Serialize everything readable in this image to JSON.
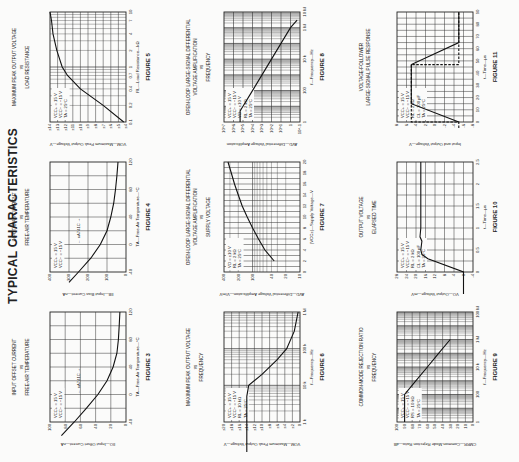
{
  "page": {
    "title": "TYPICAL CHARACTERISTICS",
    "orientation": "rotated 90° counter-clockwise"
  },
  "chart_data": [
    {
      "id": "fig5",
      "figure": "FIGURE 5",
      "type": "line",
      "title": [
        "MAXIMUM PEAK OUTPUT VOLTAGE",
        "vs",
        "LOAD RESISTANCE"
      ],
      "xlabel": "RL—Load Resistance—kΩ",
      "ylabel": "VOM—Maximum Peak Output Voltage—V",
      "xscale": "log",
      "xticks": [
        "0.1",
        "0.2",
        "0.4",
        "0.7",
        "1",
        "2",
        "4",
        "7",
        "10"
      ],
      "yticks": [
        "±4",
        "±5",
        "±6",
        "±7",
        "±8",
        "±9",
        "±10",
        "±11",
        "±12",
        "±13",
        "±14"
      ],
      "conditions": [
        "VCC+ = 15 V",
        "VCC− = −15 V",
        "TA = 25°C"
      ],
      "x": [
        0.1,
        0.2,
        0.4,
        0.7,
        1,
        2,
        4,
        7,
        10
      ],
      "y": [
        4.3,
        7.0,
        10.0,
        11.7,
        12.4,
        13.1,
        13.6,
        13.8,
        14.0
      ]
    },
    {
      "id": "fig4",
      "figure": "FIGURE 4",
      "type": "line",
      "title": [
        "INPUT BIAS CURRENT",
        "vs",
        "FREE-AIR TEMPERATURE"
      ],
      "xlabel": "TA—Free-Air Temperature—°C",
      "ylabel": "IIB—Input Bias Current—nA",
      "xticks": [
        "-40",
        "0",
        "40",
        "80",
        "120"
      ],
      "yticks": [
        "0",
        "100",
        "200",
        "300",
        "400"
      ],
      "conditions": [
        "VCC+ = 15 V",
        "VCC− = −15 V"
      ],
      "annotation": "uA741C",
      "x": [
        -55,
        -40,
        -20,
        0,
        20,
        40,
        60,
        70,
        80,
        100,
        120
      ],
      "y": [
        300,
        250,
        185,
        135,
        100,
        80,
        65,
        60,
        55,
        48,
        42
      ]
    },
    {
      "id": "fig3",
      "figure": "FIGURE 3",
      "type": "line",
      "title": [
        "INPUT OFFSET CURRENT",
        "vs",
        "FREE-AIR TEMPERATURE"
      ],
      "xlabel": "TA—Free-Air Temperature—°C",
      "ylabel": "IIO—Input Offset Current—nA",
      "xticks": [
        "-40",
        "0",
        "40",
        "80",
        "120"
      ],
      "yticks": [
        "0",
        "20",
        "40",
        "60",
        "80",
        "100"
      ],
      "conditions": [
        "VCC+ = 15 V",
        "VCC− = −15 V"
      ],
      "annotation": "uA741C",
      "x": [
        -60,
        -40,
        -20,
        0,
        20,
        40,
        60,
        80,
        100,
        120
      ],
      "y": [
        85,
        68,
        52,
        37,
        25,
        17,
        12,
        10,
        9,
        8
      ]
    },
    {
      "id": "fig8",
      "figure": "FIGURE 8",
      "type": "line",
      "title": [
        "OPEN-LOOP LARGE-SIGNAL DIFFERENTIAL",
        "VOLTAGE AMPLIFICATION",
        "vs",
        "FREQUENCY"
      ],
      "xlabel": "f—Frequency—Hz",
      "ylabel": "AVD—Differential Voltage Amplification",
      "xscale": "log",
      "yscale": "log",
      "xticks": [
        "1",
        "100",
        "10 k",
        "1 M",
        "10 M"
      ],
      "yticks": [
        "10^-1",
        "1",
        "10^1",
        "10^2",
        "10^3",
        "10^4",
        "10^5",
        "10^6",
        "10^7"
      ],
      "conditions": [
        "VCC+ = 15 V",
        "VCC− = −15 V",
        "VO = ±10 V",
        "RL = 2 kΩ",
        "TA = 25°C"
      ],
      "x": [
        1,
        5,
        10,
        100,
        1000,
        10000,
        100000,
        1000000,
        3000000
      ],
      "y": [
        200000,
        200000,
        100000,
        10000,
        1000,
        100,
        10,
        1,
        0.2
      ]
    },
    {
      "id": "fig7",
      "figure": "FIGURE 7",
      "type": "line",
      "title": [
        "OPEN-LOOP LARGE-SIGNAL DIFFERENTIAL",
        "VOLTAGE AMPLIFICATION",
        "vs",
        "SUPPLY VOLTAGE"
      ],
      "xlabel": "|VCC±|—Supply Voltage—V",
      "ylabel": "AVD—Differential Voltage Amplification—V/mV",
      "yscale": "log",
      "xticks": [
        "0",
        "2",
        "4",
        "6",
        "8",
        "10",
        "12",
        "14",
        "16",
        "18",
        "20"
      ],
      "yticks": [
        "10",
        "20",
        "40",
        "100",
        "200",
        "400"
      ],
      "conditions": [
        "VO = ±10 V",
        "RL = 2 kΩ",
        "TA = 25°C"
      ],
      "x": [
        2,
        4,
        6,
        8,
        10,
        12,
        14,
        16,
        18,
        20
      ],
      "y": [
        35,
        55,
        75,
        100,
        130,
        165,
        200,
        240,
        280,
        330
      ]
    },
    {
      "id": "fig6",
      "figure": "FIGURE 6",
      "type": "line",
      "title": [
        "MAXIMUM PEAK OUTPUT VOLTAGE",
        "vs",
        "FREQUENCY"
      ],
      "xlabel": "f—Frequency—Hz",
      "ylabel": "VOM—Maximum Peak Output Voltage—V",
      "xscale": "log",
      "xticks": [
        "1 k",
        "10 k",
        "100 k",
        "1 M"
      ],
      "yticks": [
        "0",
        "±2",
        "±4",
        "±6",
        "±8",
        "±10",
        "±12",
        "±14",
        "±16",
        "±18",
        "±20"
      ],
      "conditions": [
        "VCC+ = 15 V",
        "VCC− = −15 V",
        "RL = 10 kΩ",
        "TA = 25°C"
      ],
      "x": [
        100,
        1000,
        5000,
        10000,
        20000,
        50000,
        100000,
        300000,
        1000000
      ],
      "y": [
        14,
        14,
        14,
        13.5,
        10,
        6,
        3.5,
        1.5,
        0.5
      ]
    },
    {
      "id": "fig11",
      "figure": "FIGURE 11",
      "type": "line",
      "title": [
        "VOLTAGE-FOLLOWER",
        "LARGE-SIGNAL PULSE RESPONSE"
      ],
      "xlabel": "t—Time—μs",
      "ylabel": "Input and Output Voltage—V",
      "xticks": [
        "0",
        "10",
        "20",
        "30",
        "40",
        "50",
        "60",
        "70",
        "80",
        "90"
      ],
      "yticks": [
        "-8",
        "-6",
        "-4",
        "-2",
        "0",
        "2",
        "4",
        "6",
        "8"
      ],
      "conditions": [
        "VCC+ = 15 V",
        "VCC− = −15 V",
        "RL = 2 kΩ",
        "CL = 100 pF",
        "TA = 25°C"
      ],
      "series": [
        {
          "name": "OUTPUT",
          "x": [
            0,
            0,
            15,
            47,
            47,
            65,
            65,
            90
          ],
          "y": [
            -5,
            -5,
            5,
            5,
            5,
            -5,
            -5,
            -5
          ]
        },
        {
          "name": "INPUT",
          "x": [
            -5,
            0,
            0,
            47,
            47,
            90
          ],
          "y": [
            -5,
            -5,
            5,
            5,
            -5,
            -5
          ]
        }
      ]
    },
    {
      "id": "fig10",
      "figure": "FIGURE 10",
      "type": "line",
      "title": [
        "OUTPUT VOLTAGE",
        "vs",
        "ELAPSED TIME"
      ],
      "xlabel": "t—Time—μs",
      "ylabel": "VO—Output Voltage—mV",
      "xticks": [
        "0",
        "0.5",
        "1",
        "1.5",
        "2",
        "2.5"
      ],
      "yticks": [
        "-4",
        "0",
        "4",
        "8",
        "12",
        "16",
        "20",
        "24",
        "28"
      ],
      "conditions": [
        "VCC+ = 15 V",
        "VCC− = −15 V",
        "RL = 2 kΩ",
        "CL = 100 pF",
        "TA = 25°C"
      ],
      "annotations": [
        "10%",
        "90%",
        "tr"
      ],
      "x": [
        -0.5,
        0,
        0.3,
        0.4,
        0.5,
        0.7,
        0.8,
        1.0,
        2.5
      ],
      "y": [
        0,
        0,
        15,
        17.5,
        18,
        17.5,
        18.3,
        18,
        18
      ]
    },
    {
      "id": "fig9",
      "figure": "FIGURE 9",
      "type": "line",
      "title": [
        "COMMON-MODE REJECTION RATIO",
        "vs",
        "FREQUENCY"
      ],
      "xlabel": "f—Frequency—Hz",
      "ylabel": "CMRR—Common-Mode Rejection Ratio—dB",
      "xscale": "log",
      "xticks": [
        "1",
        "100",
        "10 k",
        "1 M",
        "100 M"
      ],
      "yticks": [
        "0",
        "10",
        "20",
        "30",
        "40",
        "50",
        "60",
        "70",
        "80",
        "90",
        "100"
      ],
      "conditions": [
        "VCC+ = 15 V",
        "VCC− = −15 V",
        "RS = 10 kΩ",
        "TA = 25°C"
      ],
      "x": [
        1,
        100,
        1000,
        10000,
        100000,
        1000000
      ],
      "y": [
        90,
        90,
        75,
        60,
        45,
        30
      ]
    }
  ]
}
